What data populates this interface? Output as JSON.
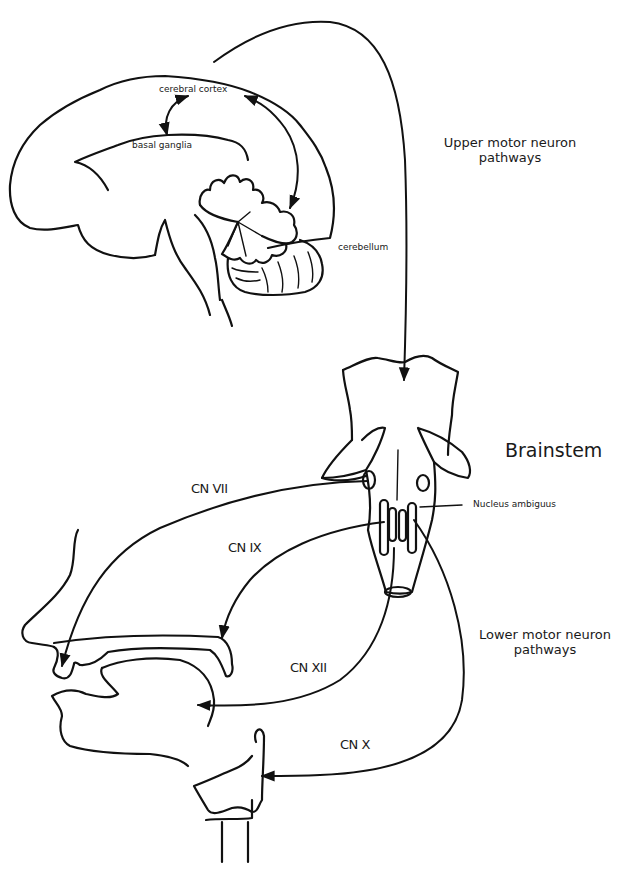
{
  "diagram": {
    "colors": {
      "line": "#111111",
      "text": "#1a1a1a",
      "background": "#ffffff"
    },
    "brain_labels": {
      "cerebral_cortex": "cerebral cortex",
      "basal_ganglia": "basal ganglia",
      "cerebellum": "cerebellum"
    },
    "brainstem_labels": {
      "brainstem": "Brainstem",
      "nucleus_ambiguus": "Nucleus ambiguus"
    },
    "pathway_labels": {
      "upper_line1": "Upper motor neuron",
      "upper_line2": "pathways",
      "lower_line1": "Lower motor neuron",
      "lower_line2": "pathways"
    },
    "cranial_nerves": [
      {
        "id": "cn7",
        "label": "CN VII",
        "target": "lips"
      },
      {
        "id": "cn9",
        "label": "CN IX",
        "target": "soft palate"
      },
      {
        "id": "cn12",
        "label": "CN XII",
        "target": "tongue"
      },
      {
        "id": "cn10",
        "label": "CN X",
        "target": "larynx"
      }
    ]
  }
}
